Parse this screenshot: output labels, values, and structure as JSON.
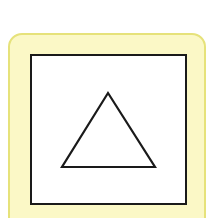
{
  "figure": {
    "card": {
      "fill": "#fbf8c6",
      "border": "#e6e27a"
    },
    "frame": {
      "fill": "#ffffff",
      "stroke": "#1a1a1a"
    },
    "shape": {
      "name": "triangle",
      "stroke": "#1a1a1a",
      "points": "108,93 62,167 155,167"
    }
  }
}
